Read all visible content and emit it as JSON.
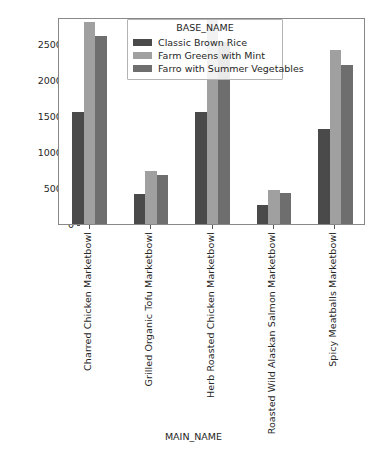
{
  "chart_data": {
    "type": "bar",
    "title": "",
    "xlabel": "MAIN_NAME",
    "ylabel": "",
    "grid": false,
    "legend_position": "upper center",
    "legend_title": "BASE_NAME",
    "ylim": [
      0,
      287000
    ],
    "yticks": [
      0,
      50000,
      100000,
      150000,
      200000,
      250000
    ],
    "ytick_labels": [
      "0",
      "50000",
      "100000",
      "150000",
      "200000",
      "250000"
    ],
    "categories": [
      "Charred Chicken Marketbowl",
      "Grilled Organic Tofu Marketbowl",
      "Herb Roasted Chicken Marketbowl",
      "Roasted Wild Alaskan Salmon Marketbowl",
      "Spicy Meatballs Marketbowl"
    ],
    "series": [
      {
        "name": "Classic Brown Rice",
        "color": "#4a4a4a",
        "values": [
          155000,
          41000,
          155000,
          27000,
          132000
        ]
      },
      {
        "name": "Farm Greens with Mint",
        "color": "#a0a0a0",
        "values": [
          280000,
          73000,
          283000,
          47000,
          241000
        ]
      },
      {
        "name": "Farro with Summer Vegetables",
        "color": "#6e6e6e",
        "values": [
          260000,
          68000,
          252000,
          43000,
          221000
        ]
      }
    ]
  }
}
